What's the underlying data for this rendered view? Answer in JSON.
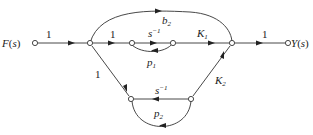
{
  "diagram": {
    "type": "signal-flow-graph",
    "input_label": "F(s)",
    "output_label": "Y(s)",
    "edges": [
      {
        "from": "F",
        "to": "n1",
        "gain": "1"
      },
      {
        "from": "n1",
        "to": "n2",
        "gain": "1"
      },
      {
        "from": "n2",
        "to": "n3",
        "gain": "s^-1"
      },
      {
        "from": "n3",
        "to": "n2",
        "gain": "p1"
      },
      {
        "from": "n3",
        "to": "n4",
        "gain": "K1"
      },
      {
        "from": "n1",
        "to": "n4",
        "gain": "b2"
      },
      {
        "from": "n4",
        "to": "Y",
        "gain": "1"
      },
      {
        "from": "n1",
        "to": "n5",
        "gain": "1"
      },
      {
        "from": "n6",
        "to": "n5",
        "gain": "s^-1"
      },
      {
        "from": "n5",
        "to": "n6",
        "gain": "p2"
      },
      {
        "from": "n6",
        "to": "n4",
        "gain": "K2"
      }
    ],
    "labels": {
      "F": "F(s)",
      "Y": "Y(s)",
      "one_a": "1",
      "one_b": "1",
      "one_c": "1",
      "one_d": "1",
      "b2": "b",
      "b2_sub": "2",
      "s_inv_top": "s",
      "s_inv_top_sup": "−1",
      "s_inv_bot": "s",
      "s_inv_bot_sup": "−1",
      "K1": "K",
      "K1_sub": "1",
      "K2": "K",
      "K2_sub": "2",
      "p1": "p",
      "p1_sub": "1",
      "p2": "p",
      "p2_sub": "2"
    }
  }
}
